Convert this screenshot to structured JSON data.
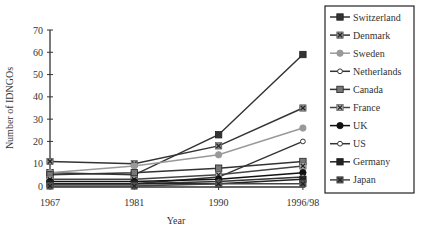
{
  "chart_data": {
    "type": "line",
    "title": "",
    "xlabel": "Year",
    "ylabel": "Number of IDNGOs",
    "ylim": [
      0,
      70
    ],
    "yticks": [
      0,
      10,
      20,
      30,
      40,
      50,
      60,
      70
    ],
    "categories": [
      "1967",
      "1981",
      "1990",
      "1996/98"
    ],
    "grid": false,
    "legend_position": "right",
    "series": [
      {
        "name": "Switzerland",
        "values": [
          6,
          5,
          23,
          59
        ],
        "marker": "square",
        "color": "#333333",
        "fill": "#333333"
      },
      {
        "name": "Denmark",
        "values": [
          11,
          10,
          18,
          35
        ],
        "marker": "x-square",
        "color": "#333333",
        "fill": "#888888"
      },
      {
        "name": "Sweden",
        "values": [
          6,
          9,
          14,
          26
        ],
        "marker": "circle",
        "color": "#999999",
        "fill": "#999999"
      },
      {
        "name": "Netherlands",
        "values": [
          1,
          1,
          4,
          20
        ],
        "marker": "open-circle",
        "color": "#333333",
        "fill": "#ffffff"
      },
      {
        "name": "Canada",
        "values": [
          5,
          6,
          8,
          11
        ],
        "marker": "square",
        "color": "#333333",
        "fill": "#777777"
      },
      {
        "name": "France",
        "values": [
          3,
          3,
          5,
          9
        ],
        "marker": "x-square",
        "color": "#444444",
        "fill": "#aaaaaa"
      },
      {
        "name": "UK",
        "values": [
          2,
          2,
          3,
          6
        ],
        "marker": "circle",
        "color": "#111111",
        "fill": "#111111"
      },
      {
        "name": "US",
        "values": [
          1,
          1,
          2,
          4
        ],
        "marker": "open-circle",
        "color": "#333333",
        "fill": "#ffffff"
      },
      {
        "name": "Germany",
        "values": [
          1,
          1,
          1,
          3
        ],
        "marker": "square",
        "color": "#222222",
        "fill": "#222222"
      },
      {
        "name": "Japan",
        "values": [
          0,
          0,
          1,
          1
        ],
        "marker": "x-square",
        "color": "#444444",
        "fill": "#555555"
      }
    ]
  }
}
